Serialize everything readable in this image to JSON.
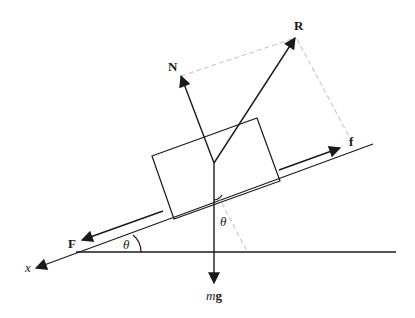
{
  "diagram": {
    "labels": {
      "normal_force": "N",
      "resultant": "R",
      "friction": "f",
      "applied_force": "F",
      "weight_m": "m",
      "weight_g": "g",
      "angle_incline": "θ",
      "angle_weight": "θ",
      "axis": "x"
    },
    "colors": {
      "line": "#1a1a1a",
      "dashed": "#c8c8c8"
    }
  }
}
